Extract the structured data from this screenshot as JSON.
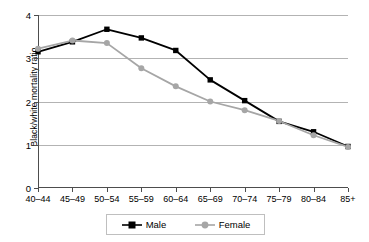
{
  "chart_data": {
    "type": "line",
    "title": "",
    "xlabel": "",
    "ylabel": "Black/white mortality ratio",
    "categories": [
      "40–44",
      "45–49",
      "50–54",
      "55–59",
      "60–64",
      "65–69",
      "70–74",
      "75–79",
      "80–84",
      "85+"
    ],
    "ylim": [
      0,
      4
    ],
    "yticks": [
      0,
      1,
      2,
      3,
      4
    ],
    "ytick_labels": [
      "0",
      "1",
      "2",
      "3",
      "4"
    ],
    "grid": true,
    "legend_position": "bottom",
    "series": [
      {
        "name": "Male",
        "color": "#000000",
        "marker": "square",
        "values": [
          3.15,
          3.38,
          3.67,
          3.47,
          3.18,
          2.5,
          2.02,
          1.54,
          1.3,
          0.96
        ]
      },
      {
        "name": "Female",
        "color": "#a6a6a6",
        "marker": "circle",
        "values": [
          3.22,
          3.41,
          3.35,
          2.77,
          2.35,
          2.0,
          1.8,
          1.55,
          1.22,
          0.95
        ]
      }
    ]
  }
}
